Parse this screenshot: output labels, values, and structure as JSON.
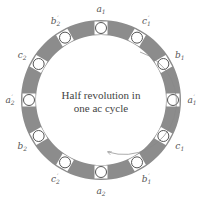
{
  "diagram": {
    "center_text": {
      "line1": "Half revolution in",
      "line2": "one ac cycle"
    },
    "colors": {
      "ring": "#8c8c8c",
      "slot_fill": "#ffffff",
      "slot_stroke": "#555555",
      "text": "#555555",
      "arrow": "#888888"
    },
    "slots": [
      {
        "label": "a",
        "sub": "1",
        "prime": "",
        "angle": 90
      },
      {
        "label": "c",
        "sub": "1",
        "prime": "′",
        "angle": 60
      },
      {
        "label": "b",
        "sub": "1",
        "prime": "",
        "angle": 30
      },
      {
        "label": "a",
        "sub": "1",
        "prime": "′",
        "angle": 0
      },
      {
        "label": "c",
        "sub": "1",
        "prime": "",
        "angle": -30
      },
      {
        "label": "b",
        "sub": "1",
        "prime": "′",
        "angle": -60
      },
      {
        "label": "a",
        "sub": "2",
        "prime": "",
        "angle": -90
      },
      {
        "label": "c",
        "sub": "2",
        "prime": "′",
        "angle": -120
      },
      {
        "label": "b",
        "sub": "2",
        "prime": "",
        "angle": -150
      },
      {
        "label": "a",
        "sub": "2",
        "prime": "′",
        "angle": 180
      },
      {
        "label": "c",
        "sub": "2",
        "prime": "",
        "angle": 150
      },
      {
        "label": "b",
        "sub": "2",
        "prime": "′",
        "angle": 120
      }
    ]
  }
}
